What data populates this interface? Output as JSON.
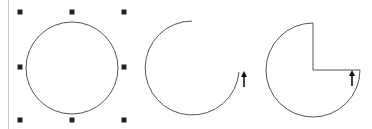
{
  "figure": {
    "colors": {
      "background": "#ffffff",
      "stroke": "#555555",
      "handle": "#222222",
      "margin_line": "#c8c8c8",
      "arrow": "#111111"
    },
    "shapes": [
      {
        "name": "circle",
        "cx": 72,
        "cy": 68,
        "r": 46,
        "selected": true
      },
      {
        "name": "arc",
        "cx": 192,
        "cy": 68,
        "r": 47,
        "start_angle_deg": 270,
        "end_angle_deg": 5,
        "direction": "counterclockwise"
      },
      {
        "name": "pie",
        "cx": 313,
        "cy": 70,
        "r": 47,
        "missing_quadrant": "top-right"
      }
    ],
    "handles": [
      {
        "x": 20,
        "y": 12
      },
      {
        "x": 72,
        "y": 12
      },
      {
        "x": 124,
        "y": 12
      },
      {
        "x": 20,
        "y": 67
      },
      {
        "x": 124,
        "y": 67
      },
      {
        "x": 20,
        "y": 120
      },
      {
        "x": 72,
        "y": 120
      },
      {
        "x": 124,
        "y": 120
      }
    ],
    "arrows": [
      {
        "name": "arc-arrow",
        "x": 244,
        "y": 80,
        "direction": "up"
      },
      {
        "name": "pie-arrow",
        "x": 352,
        "y": 79,
        "direction": "up"
      }
    ]
  }
}
